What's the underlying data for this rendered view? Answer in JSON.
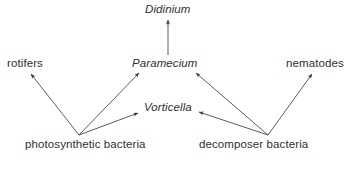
{
  "diagram": {
    "type": "food-web",
    "background_color": "#ffffff",
    "line_color": "#4a4a4a",
    "text_color": "#2f2f2f",
    "nodes": [
      {
        "id": "didinium",
        "label": "Didinium",
        "style": "italic",
        "x": 145,
        "y": 3
      },
      {
        "id": "rotifers",
        "label": "rotifers",
        "style": "roman",
        "x": 7,
        "y": 57
      },
      {
        "id": "paramecium",
        "label": "Paramecium",
        "style": "italic",
        "x": 132,
        "y": 57
      },
      {
        "id": "nematodes",
        "label": "nematodes",
        "style": "roman",
        "x": 286,
        "y": 57
      },
      {
        "id": "vorticella",
        "label": "Vorticella",
        "style": "italic",
        "x": 144,
        "y": 101
      },
      {
        "id": "photosynthetic-bacteria",
        "label": "photosynthetic bacteria",
        "style": "roman",
        "x": 25,
        "y": 138
      },
      {
        "id": "decomposer-bacteria",
        "label": "decomposer bacteria",
        "style": "roman",
        "x": 199,
        "y": 138
      }
    ],
    "edges": [
      {
        "id": "paramecium-to-didinium",
        "from": "paramecium",
        "to": "didinium",
        "x1": 168,
        "y1": 55,
        "x2": 168,
        "y2": 20
      },
      {
        "id": "photosynthetic-bacteria-to-rotifers",
        "from": "photosynthetic-bacteria",
        "to": "rotifers",
        "x1": 79,
        "y1": 135,
        "x2": 31,
        "y2": 74
      },
      {
        "id": "photosynthetic-bacteria-to-paramecium",
        "from": "photosynthetic-bacteria",
        "to": "paramecium",
        "x1": 79,
        "y1": 135,
        "x2": 139,
        "y2": 73
      },
      {
        "id": "photosynthetic-bacteria-to-vorticella",
        "from": "photosynthetic-bacteria",
        "to": "vorticella",
        "x1": 79,
        "y1": 135,
        "x2": 138,
        "y2": 113
      },
      {
        "id": "decomposer-bacteria-to-paramecium",
        "from": "decomposer-bacteria",
        "to": "paramecium",
        "x1": 268,
        "y1": 135,
        "x2": 196,
        "y2": 73
      },
      {
        "id": "decomposer-bacteria-to-vorticella",
        "from": "decomposer-bacteria",
        "to": "vorticella",
        "x1": 268,
        "y1": 135,
        "x2": 199,
        "y2": 112
      },
      {
        "id": "decomposer-bacteria-to-nematodes",
        "from": "decomposer-bacteria",
        "to": "nematodes",
        "x1": 268,
        "y1": 135,
        "x2": 312,
        "y2": 74
      }
    ]
  }
}
